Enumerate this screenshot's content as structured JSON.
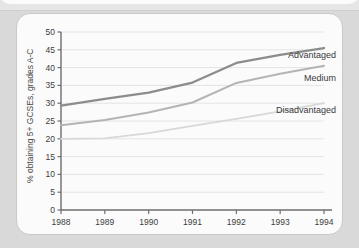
{
  "chart_data": {
    "type": "line",
    "title": "",
    "subtitle": "",
    "xlabel": "",
    "ylabel": "% obtaining 5+ GCSEs, grades A-C",
    "x": [
      1988,
      1989,
      1990,
      1991,
      1992,
      1993,
      1994
    ],
    "xtick_labels": [
      "1988",
      "1989",
      "1990",
      "1991",
      "1992",
      "1993",
      "1994"
    ],
    "ytick_labels": [
      "0",
      "5",
      "10",
      "15",
      "20",
      "25",
      "30",
      "35",
      "40",
      "45",
      "50"
    ],
    "ytick_values": [
      0,
      5,
      10,
      15,
      20,
      25,
      30,
      35,
      40,
      45,
      50
    ],
    "ylim": [
      0,
      50
    ],
    "xlim": [
      1988,
      1994
    ],
    "grid": "horizontal",
    "legend_position": "inline-right-of-lines",
    "series": [
      {
        "name": "Advantaged",
        "label": "Advantaged",
        "color": "#8c8c8c",
        "values": [
          29.3,
          31.2,
          33.0,
          35.8,
          41.3,
          43.6,
          45.5
        ]
      },
      {
        "name": "Medium",
        "label": "Medium",
        "color": "#b4b4b4",
        "values": [
          23.8,
          25.3,
          27.4,
          30.2,
          35.7,
          38.3,
          40.5
        ]
      },
      {
        "name": "Disadvantaged",
        "label": "Disadvantaged",
        "color": "#d8d8d8",
        "values": [
          20.0,
          20.1,
          21.6,
          23.6,
          25.6,
          27.7,
          30.0
        ]
      }
    ],
    "annotations": [
      {
        "text": "Advantaged",
        "series": "Advantaged"
      },
      {
        "text": "Medium",
        "series": "Medium"
      },
      {
        "text": "Disadvantaged",
        "series": "Disadvantaged"
      }
    ]
  },
  "colors": {
    "page_background": "#d9d9d9",
    "card_background": "#fbfbfb",
    "card_border": "#c9c9c9",
    "axis": "#6e6e6e",
    "grid": "#e4e4e4",
    "text": "#3d3d3d"
  }
}
